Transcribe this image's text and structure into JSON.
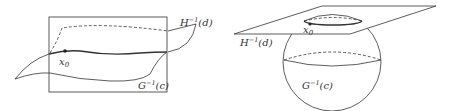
{
  "left_figure": {
    "labels": {
      "H_label": {
        "base": "H",
        "sup": "−1",
        "arg": "(d)"
      },
      "G_label": {
        "base": "G",
        "sup": "−1",
        "arg": "(c)"
      },
      "point_label": {
        "base": "x",
        "sub": "0"
      }
    }
  },
  "right_figure": {
    "labels": {
      "H_label": {
        "base": "H",
        "sup": "−1",
        "arg": "(d)"
      },
      "G_label": {
        "base": "G",
        "sup": "−1",
        "arg": "(c)"
      },
      "point_label": {
        "base": "x",
        "sub": "0"
      }
    }
  },
  "colors": {
    "stroke": "#333333",
    "background": "#ffffff"
  }
}
